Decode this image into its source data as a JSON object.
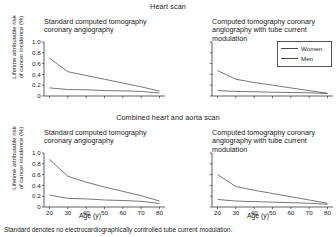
{
  "figure": {
    "sections": [
      {
        "id": "heart-scan",
        "title": "Heart scan"
      },
      {
        "id": "combined-scan",
        "title": "Combined heart and aorta scan"
      }
    ],
    "footnote": "Standard denotes no electrocardiographically controlled tube current modulation.",
    "legend": {
      "position": "top-right",
      "entries": [
        {
          "label": "Women",
          "color": "#4a4a4a"
        },
        {
          "label": "Men",
          "color": "#4a4a4a"
        }
      ]
    },
    "axis": {
      "xlabel": "Age (y)",
      "ylabel_line1": "Lifetime attributable risk",
      "ylabel_line2": "of cancer incidence (%)",
      "xticks": [
        "20",
        "30",
        "40",
        "50",
        "60",
        "70",
        "80"
      ],
      "yticks": [
        "0",
        "0.2",
        "0.4",
        "0.6",
        "0.8",
        "1.0"
      ]
    }
  },
  "chart_data": [
    {
      "id": "heart-standard",
      "type": "line",
      "title": "Standard computed tomography coronary angiography",
      "section": "Heart scan",
      "xlabel": "Age (y)",
      "ylabel": "Lifetime attributable risk of cancer incidence (%)",
      "x": [
        20,
        30,
        40,
        50,
        60,
        70,
        80
      ],
      "xlim": [
        17,
        83
      ],
      "ylim": [
        0,
        1.0
      ],
      "grid": false,
      "series": [
        {
          "name": "Women",
          "values": [
            0.7,
            0.45,
            0.38,
            0.31,
            0.24,
            0.17,
            0.09
          ]
        },
        {
          "name": "Men",
          "values": [
            0.15,
            0.12,
            0.115,
            0.1,
            0.095,
            0.085,
            0.055
          ]
        }
      ]
    },
    {
      "id": "heart-modulation",
      "type": "line",
      "title": "Computed tomography coronary angiography with tube current modulation",
      "section": "Heart scan",
      "xlabel": "Age (y)",
      "ylabel": "Lifetime attributable risk of cancer incidence (%)",
      "x": [
        20,
        30,
        40,
        50,
        60,
        70,
        80
      ],
      "xlim": [
        17,
        83
      ],
      "ylim": [
        0,
        1.0
      ],
      "grid": false,
      "series": [
        {
          "name": "Women",
          "values": [
            0.47,
            0.31,
            0.25,
            0.2,
            0.15,
            0.1,
            0.05
          ]
        },
        {
          "name": "Men",
          "values": [
            0.1,
            0.085,
            0.08,
            0.07,
            0.065,
            0.06,
            0.045
          ]
        }
      ]
    },
    {
      "id": "combined-standard",
      "type": "line",
      "title": "Standard computed tomography coronary angiography",
      "section": "Combined heart and aorta scan",
      "xlabel": "Age (y)",
      "ylabel": "Lifetime attributable risk of cancer incidence (%)",
      "x": [
        20,
        30,
        40,
        50,
        60,
        70,
        80
      ],
      "xlim": [
        17,
        83
      ],
      "ylim": [
        0,
        1.0
      ],
      "grid": false,
      "series": [
        {
          "name": "Women",
          "values": [
            0.88,
            0.57,
            0.46,
            0.37,
            0.29,
            0.21,
            0.11
          ]
        },
        {
          "name": "Men",
          "values": [
            0.22,
            0.16,
            0.15,
            0.13,
            0.12,
            0.105,
            0.065
          ]
        }
      ]
    },
    {
      "id": "combined-modulation",
      "type": "line",
      "title": "Computed tomography coronary angiography with tube current modulation",
      "section": "Combined heart and aorta scan",
      "xlabel": "Age (y)",
      "ylabel": "Lifetime attributable risk of cancer incidence (%)",
      "x": [
        20,
        30,
        40,
        50,
        60,
        70,
        80
      ],
      "xlim": [
        17,
        83
      ],
      "ylim": [
        0,
        1.0
      ],
      "grid": false,
      "series": [
        {
          "name": "Women",
          "values": [
            0.6,
            0.38,
            0.31,
            0.25,
            0.19,
            0.13,
            0.07
          ]
        },
        {
          "name": "Men",
          "values": [
            0.14,
            0.11,
            0.1,
            0.09,
            0.08,
            0.07,
            0.05
          ]
        }
      ]
    }
  ]
}
